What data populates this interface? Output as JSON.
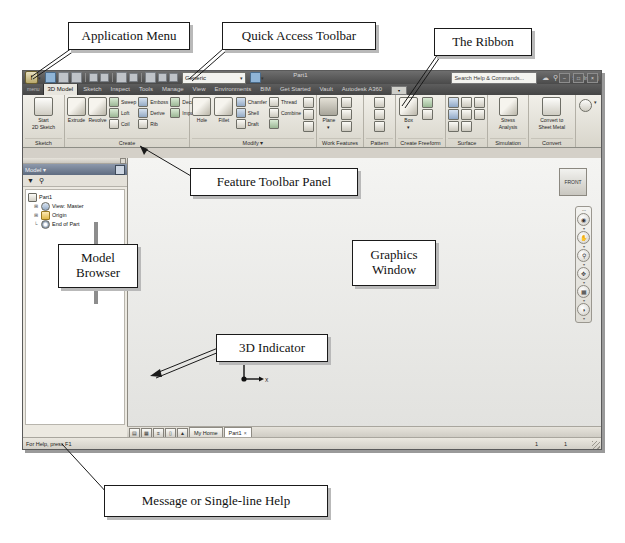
{
  "annotations": [
    {
      "id": "application-menu",
      "text": "Application Menu"
    },
    {
      "id": "quick-access-toolbar",
      "text": "Quick Access Toolbar"
    },
    {
      "id": "the-ribbon",
      "text": "The Ribbon"
    },
    {
      "id": "feature-toolbar-panel",
      "text": "Feature Toolbar Panel"
    },
    {
      "id": "model-browser",
      "text": "Model\nBrowser"
    },
    {
      "id": "graphics-window",
      "text": "Graphics\nWindow"
    },
    {
      "id": "3d-indicator",
      "text": "3D Indicator"
    },
    {
      "id": "message-or-help",
      "text": "Message or Single-line Help"
    }
  ],
  "annotation_text": {
    "application_menu": "Application Menu",
    "quick_access_toolbar": "Quick Access Toolbar",
    "the_ribbon": "The Ribbon",
    "feature_toolbar_panel": "Feature Toolbar Panel",
    "model_browser_line1": "Model",
    "model_browser_line2": "Browser",
    "graphics_window_line1": "Graphics",
    "graphics_window_line2": "Window",
    "three_d_indicator": "3D Indicator",
    "message_help": "Message or Single-line Help"
  },
  "window": {
    "app_button_label": "I",
    "material_combo": "Generic",
    "document_title": "Part1",
    "search_placeholder": "Search Help & Commands...",
    "sign_in": "Sign In",
    "min_label": "–",
    "max_label": "□",
    "close_label": "×"
  },
  "tabs": {
    "menu_label": "menu",
    "items": [
      {
        "label": "3D Model",
        "active": true
      },
      {
        "label": "Sketch",
        "active": false
      },
      {
        "label": "Inspect",
        "active": false
      },
      {
        "label": "Tools",
        "active": false
      },
      {
        "label": "Manage",
        "active": false
      },
      {
        "label": "View",
        "active": false
      },
      {
        "label": "Environments",
        "active": false
      },
      {
        "label": "BIM",
        "active": false
      },
      {
        "label": "Get Started",
        "active": false
      },
      {
        "label": "Vault",
        "active": false
      },
      {
        "label": "Autodesk A360",
        "active": false
      }
    ]
  },
  "ribbon": {
    "panels": [
      {
        "title": "Sketch",
        "big": [
          {
            "label1": "Start",
            "label2": "2D Sketch"
          }
        ],
        "small": []
      },
      {
        "title": "Create",
        "big": [
          {
            "label1": "Extrude",
            "label2": ""
          },
          {
            "label1": "Revolve",
            "label2": ""
          }
        ],
        "small": [
          [
            "Sweep",
            "Emboss",
            "Decal"
          ],
          [
            "Loft",
            "Derive",
            "Import"
          ],
          [
            "Coil",
            "Rib",
            ""
          ]
        ]
      },
      {
        "title": "Modify ▾",
        "big": [
          {
            "label1": "Hole",
            "label2": ""
          },
          {
            "label1": "Fillet",
            "label2": ""
          }
        ],
        "small": [
          [
            "Chamfer",
            "Thread"
          ],
          [
            "Shell",
            "Combine"
          ],
          [
            "Draft",
            ""
          ]
        ]
      },
      {
        "title": "Work Features",
        "big": [
          {
            "label1": "Plane",
            "label2": "▾"
          }
        ],
        "small": []
      },
      {
        "title": "Pattern",
        "big": [],
        "small": []
      },
      {
        "title": "Create Freeform",
        "big": [
          {
            "label1": "Box",
            "label2": "▾"
          }
        ],
        "small": []
      },
      {
        "title": "Surface",
        "big": [],
        "small": []
      },
      {
        "title": "Simulation",
        "big": [
          {
            "label1": "Stress",
            "label2": "Analysis"
          }
        ],
        "small": []
      },
      {
        "title": "Convert",
        "big": [
          {
            "label1": "Convert to",
            "label2": "Sheet Metal"
          }
        ],
        "small": []
      }
    ]
  },
  "browser": {
    "header_label": "Model ▾",
    "filter_icon": "filter-icon",
    "search_icon": "search-icon",
    "tree": [
      {
        "label": "Part1",
        "indent": 0,
        "expander": "",
        "icon": "part-icon"
      },
      {
        "label": "View: Master",
        "indent": 1,
        "expander": "⊞",
        "icon": "view-icon"
      },
      {
        "label": "Origin",
        "indent": 1,
        "expander": "⊞",
        "icon": "folder-icon"
      },
      {
        "label": "End of Part",
        "indent": 1,
        "expander": "└",
        "icon": "end-of-part-icon"
      }
    ]
  },
  "graphics": {
    "viewcube_label": "FRONT",
    "nav_items": [
      "steering-wheel-icon",
      "pan-icon",
      "zoom-icon",
      "orbit-icon",
      "look-at-icon",
      "view-style-icon"
    ],
    "indicator": {
      "y_axis": "Y",
      "x_axis": "X"
    }
  },
  "doc_tabs": {
    "view_buttons": [
      "☰",
      "▦",
      "≡",
      "▯",
      "▲"
    ],
    "items": [
      {
        "label": "My Home",
        "active": false,
        "close": ""
      },
      {
        "label": "Part1",
        "active": true,
        "close": "×"
      }
    ]
  },
  "status": {
    "message": "For Help, press F1",
    "field_1": "1",
    "field_2": "1"
  }
}
